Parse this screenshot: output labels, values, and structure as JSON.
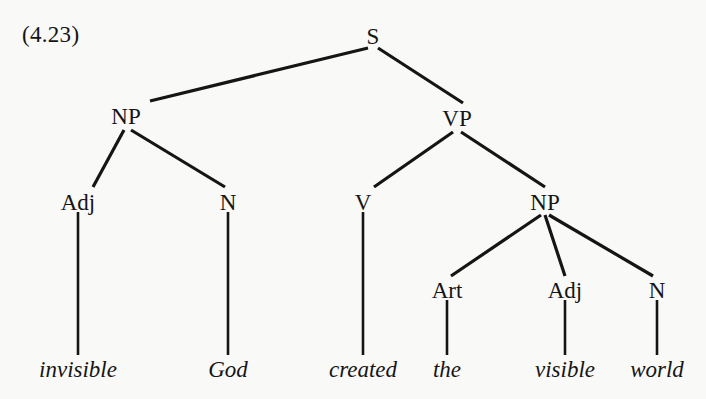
{
  "figure": {
    "example_number": "(4.23)",
    "sentence": "invisible God created the visible world",
    "ink_color": "#151515",
    "background_color": "#f9f9f8"
  },
  "tree": {
    "nodes": {
      "s": {
        "label": "S",
        "x": 373,
        "y": 36
      },
      "np_subject": {
        "label": "NP",
        "x": 126,
        "y": 116
      },
      "vp": {
        "label": "VP",
        "x": 457,
        "y": 118
      },
      "adj_subject": {
        "label": "Adj",
        "x": 78,
        "y": 202
      },
      "n_subject": {
        "label": "N",
        "x": 228,
        "y": 202
      },
      "v": {
        "label": "V",
        "x": 363,
        "y": 202
      },
      "np_object": {
        "label": "NP",
        "x": 545,
        "y": 202
      },
      "art_object": {
        "label": "Art",
        "x": 447,
        "y": 290
      },
      "adj_object": {
        "label": "Adj",
        "x": 565,
        "y": 290
      },
      "n_object": {
        "label": "N",
        "x": 657,
        "y": 290
      }
    },
    "terminals": [
      {
        "word": "invisible",
        "x": 78,
        "y": 375,
        "parent": "Adj"
      },
      {
        "word": "God",
        "x": 228,
        "y": 375,
        "parent": "N"
      },
      {
        "word": "created",
        "x": 363,
        "y": 375,
        "parent": "V"
      },
      {
        "word": "the",
        "x": 447,
        "y": 375,
        "parent": "Art"
      },
      {
        "word": "visible",
        "x": 565,
        "y": 375,
        "parent": "Adj"
      },
      {
        "word": "world",
        "x": 657,
        "y": 375,
        "parent": "N"
      }
    ],
    "edges": [
      {
        "from": "S",
        "to": "NP",
        "x1": 368,
        "y1": 48,
        "x2": 150,
        "y2": 101
      },
      {
        "from": "S",
        "to": "VP",
        "x1": 378,
        "y1": 48,
        "x2": 463,
        "y2": 103
      },
      {
        "from": "NP",
        "to": "Adj",
        "x1": 124,
        "y1": 130,
        "x2": 93,
        "y2": 187
      },
      {
        "from": "NP",
        "to": "N",
        "x1": 131,
        "y1": 130,
        "x2": 225,
        "y2": 187
      },
      {
        "from": "VP",
        "to": "V",
        "x1": 453,
        "y1": 132,
        "x2": 374,
        "y2": 187
      },
      {
        "from": "VP",
        "to": "NP",
        "x1": 461,
        "y1": 132,
        "x2": 545,
        "y2": 187
      },
      {
        "from": "Adj",
        "to": "invisible",
        "x1": 78,
        "y1": 212,
        "x2": 78,
        "y2": 355
      },
      {
        "from": "N",
        "to": "God",
        "x1": 228,
        "y1": 212,
        "x2": 228,
        "y2": 355
      },
      {
        "from": "V",
        "to": "created",
        "x1": 363,
        "y1": 212,
        "x2": 363,
        "y2": 355
      },
      {
        "from": "NP",
        "to": "Art",
        "x1": 541,
        "y1": 215,
        "x2": 451,
        "y2": 276
      },
      {
        "from": "NP",
        "to": "Adj",
        "x1": 545,
        "y1": 215,
        "x2": 565,
        "y2": 276
      },
      {
        "from": "NP",
        "to": "N",
        "x1": 549,
        "y1": 215,
        "x2": 653,
        "y2": 276
      },
      {
        "from": "Art",
        "to": "the",
        "x1": 447,
        "y1": 300,
        "x2": 447,
        "y2": 355
      },
      {
        "from": "Adj",
        "to": "visible",
        "x1": 565,
        "y1": 300,
        "x2": 565,
        "y2": 355
      },
      {
        "from": "N",
        "to": "world",
        "x1": 657,
        "y1": 300,
        "x2": 657,
        "y2": 355
      }
    ]
  }
}
